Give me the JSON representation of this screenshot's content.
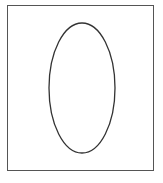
{
  "diagram": {
    "frame": {
      "x": 7,
      "y": 5,
      "width": 147,
      "height": 166,
      "stroke": "#555555"
    },
    "shape": {
      "type": "ellipse",
      "cx": 82,
      "cy": 88,
      "rx": 33,
      "ry": 65,
      "stroke": "#333333",
      "stroke_width": 1.3,
      "fill": "none"
    }
  }
}
